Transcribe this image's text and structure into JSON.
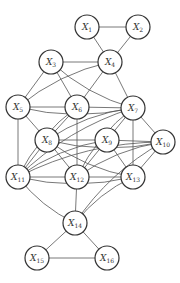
{
  "diagram": {
    "type": "undirected-graph",
    "node_radius": 12,
    "nodes": [
      {
        "id": "X1",
        "label": "X",
        "sub": "1",
        "x": 87,
        "y": 27
      },
      {
        "id": "X2",
        "label": "X",
        "sub": "2",
        "x": 138,
        "y": 27
      },
      {
        "id": "X3",
        "label": "X",
        "sub": "3",
        "x": 51,
        "y": 62
      },
      {
        "id": "X4",
        "label": "X",
        "sub": "4",
        "x": 110,
        "y": 62
      },
      {
        "id": "X5",
        "label": "X",
        "sub": "5",
        "x": 18,
        "y": 107
      },
      {
        "id": "X6",
        "label": "X",
        "sub": "6",
        "x": 77,
        "y": 107
      },
      {
        "id": "X7",
        "label": "X",
        "sub": "7",
        "x": 133,
        "y": 108
      },
      {
        "id": "X8",
        "label": "X",
        "sub": "8",
        "x": 47,
        "y": 140
      },
      {
        "id": "X9",
        "label": "X",
        "sub": "9",
        "x": 107,
        "y": 140
      },
      {
        "id": "X10",
        "label": "X",
        "sub": "10",
        "x": 163,
        "y": 142
      },
      {
        "id": "X11",
        "label": "X",
        "sub": "11",
        "x": 18,
        "y": 177
      },
      {
        "id": "X12",
        "label": "X",
        "sub": "12",
        "x": 77,
        "y": 177
      },
      {
        "id": "X13",
        "label": "X",
        "sub": "13",
        "x": 133,
        "y": 177
      },
      {
        "id": "X14",
        "label": "X",
        "sub": "14",
        "x": 75,
        "y": 223
      },
      {
        "id": "X15",
        "label": "X",
        "sub": "15",
        "x": 37,
        "y": 258
      },
      {
        "id": "X16",
        "label": "X",
        "sub": "16",
        "x": 107,
        "y": 258
      }
    ],
    "edges": [
      [
        "X1",
        "X2"
      ],
      [
        "X1",
        "X4"
      ],
      [
        "X2",
        "X4"
      ],
      [
        "X3",
        "X4"
      ],
      [
        "X3",
        "X5"
      ],
      [
        "X3",
        "X6"
      ],
      [
        "X3",
        "X7"
      ],
      [
        "X4",
        "X5"
      ],
      [
        "X4",
        "X6"
      ],
      [
        "X4",
        "X7"
      ],
      [
        "X5",
        "X6"
      ],
      [
        "X5",
        "X8"
      ],
      [
        "X5",
        "X11"
      ],
      [
        "X5",
        "X7"
      ],
      [
        "X6",
        "X7"
      ],
      [
        "X6",
        "X8"
      ],
      [
        "X6",
        "X12"
      ],
      [
        "X6",
        "X11"
      ],
      [
        "X7",
        "X9"
      ],
      [
        "X7",
        "X10"
      ],
      [
        "X7",
        "X11"
      ],
      [
        "X7",
        "X12"
      ],
      [
        "X7",
        "X13"
      ],
      [
        "X7",
        "X8"
      ],
      [
        "X8",
        "X9"
      ],
      [
        "X8",
        "X10"
      ],
      [
        "X8",
        "X12"
      ],
      [
        "X8",
        "X13"
      ],
      [
        "X8",
        "X11"
      ],
      [
        "X9",
        "X10"
      ],
      [
        "X9",
        "X11"
      ],
      [
        "X9",
        "X12"
      ],
      [
        "X9",
        "X13"
      ],
      [
        "X10",
        "X11"
      ],
      [
        "X10",
        "X13"
      ],
      [
        "X10",
        "X12"
      ],
      [
        "X10",
        "X14"
      ],
      [
        "X11",
        "X12"
      ],
      [
        "X11",
        "X13"
      ],
      [
        "X11",
        "X14"
      ],
      [
        "X12",
        "X13"
      ],
      [
        "X12",
        "X14"
      ],
      [
        "X13",
        "X14"
      ],
      [
        "X14",
        "X15"
      ],
      [
        "X14",
        "X16"
      ],
      [
        "X15",
        "X16"
      ]
    ]
  }
}
